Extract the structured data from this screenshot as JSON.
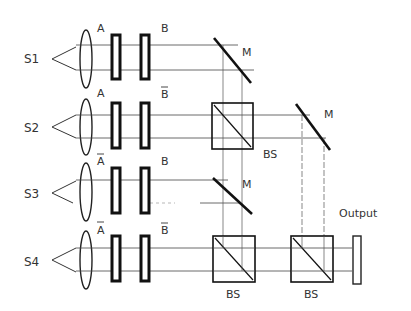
{
  "colors": {
    "ink": "#1a1a1a",
    "light_ink": "#555555",
    "background": "#ffffff"
  },
  "sources": [
    {
      "label": "S1",
      "mask_a": "A",
      "mask_b": "B"
    },
    {
      "label": "S2",
      "mask_a": "A",
      "mask_b": "B̄"
    },
    {
      "label": "S3",
      "mask_a": "Ā",
      "mask_b": "B"
    },
    {
      "label": "S4",
      "mask_a": "Ā",
      "mask_b": "B̄"
    }
  ],
  "labels": {
    "s1": "S1",
    "s2": "S2",
    "s3": "S3",
    "s4": "S4",
    "a1": "A",
    "b1": "B",
    "a2": "A",
    "b2": "B",
    "a3": "A",
    "b3": "B",
    "a4": "A",
    "b4": "B",
    "mirror1": "M",
    "mirror2": "M",
    "mirror3": "M",
    "bs1": "BS",
    "bs2": "BS",
    "bs3": "BS",
    "output": "Output"
  }
}
